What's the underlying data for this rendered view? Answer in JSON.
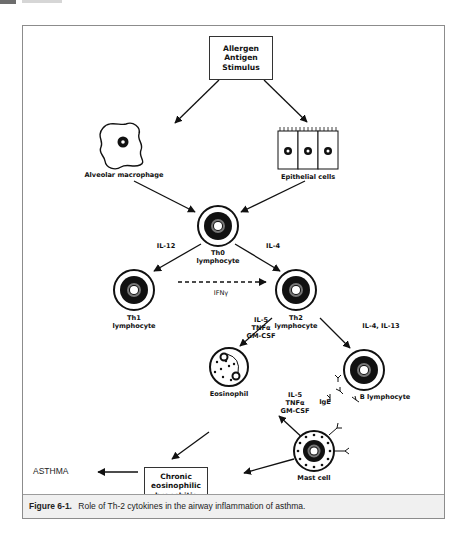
{
  "page_header": {
    "tab_color": "#6d6d6d"
  },
  "diagram": {
    "title_box": {
      "lines": [
        "Allergen",
        "Antigen",
        "Stimulus"
      ]
    },
    "nodes": {
      "alveolar_macrophage": "Alveolar macrophage",
      "epithelial_cells": "Epithelial cells",
      "th0": [
        "Th0",
        "lymphocyte"
      ],
      "th1": [
        "Th1",
        "lymphocyte"
      ],
      "th2": [
        "Th2",
        "lymphocyte"
      ],
      "eosinophil": "Eosinophil",
      "b_lymphocyte": "B lymphocyte",
      "mast_cell": "Mast cell"
    },
    "edge_labels": {
      "il12": "IL-12",
      "il4": "IL-4",
      "ifn": "IFNγ",
      "th2_to_eos": [
        "IL-5",
        "TNFα",
        "GM-CSF"
      ],
      "th2_to_b": "IL-4, IL-13",
      "mast_to_eos": [
        "IL-5",
        "TNFα",
        "GM-CSF"
      ],
      "ige": "IgE"
    },
    "outcome_box": {
      "lines": [
        "Chronic",
        "eosinophilic",
        "bronchitis"
      ]
    },
    "outcome": "ASTHMA"
  },
  "caption": {
    "figure_number": "Figure 6-1.",
    "text": "Role of Th-2 cytokines in the airway inflammation of asthma."
  }
}
